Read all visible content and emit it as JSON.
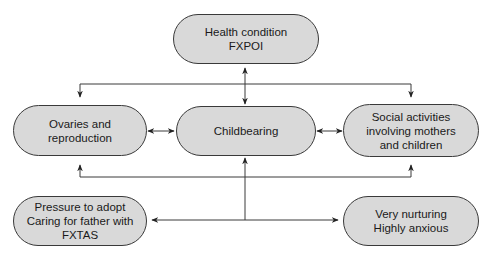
{
  "diagram": {
    "nodes": {
      "health": {
        "line1": "Health condition",
        "line2": "FXPOI"
      },
      "ovaries": {
        "line1": "Ovaries and",
        "line2": "reproduction"
      },
      "childbearing": {
        "line1": "Childbearing"
      },
      "social": {
        "line1": "Social activities",
        "line2": "involving mothers",
        "line3": "and children"
      },
      "pressure": {
        "line1": "Pressure to adopt",
        "line2": "Caring for father with",
        "line3": "FXTAS"
      },
      "nurturing": {
        "line1": "Very nurturing",
        "line2": "Highly anxious"
      }
    },
    "edges": [
      {
        "from": "health",
        "to": "childbearing",
        "type": "bidirectional"
      },
      {
        "from": "health",
        "to": "ovaries",
        "type": "directed"
      },
      {
        "from": "health",
        "to": "social",
        "type": "directed"
      },
      {
        "from": "ovaries",
        "to": "childbearing",
        "type": "bidirectional"
      },
      {
        "from": "childbearing",
        "to": "social",
        "type": "bidirectional"
      },
      {
        "from": "bottom-hub",
        "to": "ovaries",
        "type": "directed"
      },
      {
        "from": "bottom-hub",
        "to": "childbearing",
        "type": "directed"
      },
      {
        "from": "bottom-hub",
        "to": "social",
        "type": "directed"
      },
      {
        "from": "bottom-hub",
        "to": "pressure",
        "type": "directed"
      },
      {
        "from": "bottom-hub",
        "to": "nurturing",
        "type": "directed"
      }
    ],
    "colors": {
      "node_fill": "#d9d9d9",
      "stroke": "#3a3a3a"
    }
  }
}
